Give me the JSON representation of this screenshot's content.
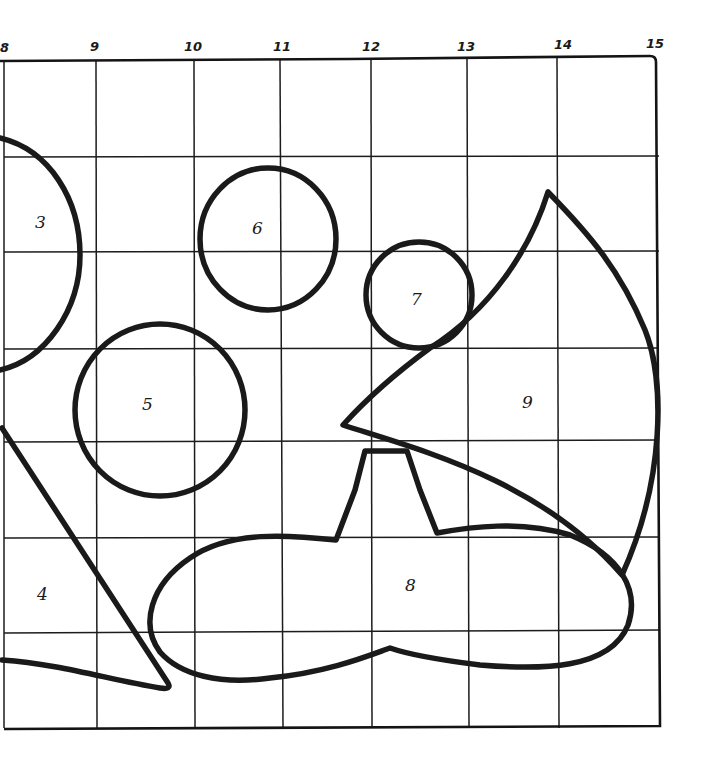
{
  "diagram": {
    "type": "grid-puzzle-shapes",
    "column_labels": [
      "8",
      "9",
      "10",
      "11",
      "12",
      "13",
      "14",
      "15"
    ],
    "shape_labels": {
      "s3": "3",
      "s4": "4",
      "s5": "5",
      "s6": "6",
      "s7": "7",
      "s8": "8",
      "s9": "9"
    },
    "colors": {
      "ink": "#1a1a1a",
      "paper": "#ffffff"
    }
  }
}
